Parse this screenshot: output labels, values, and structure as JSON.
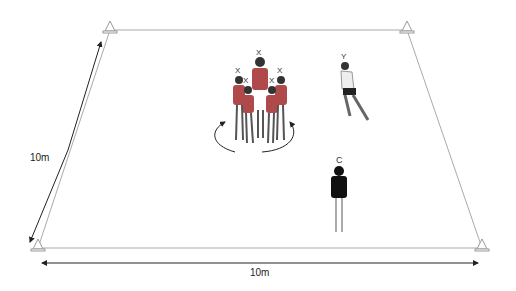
{
  "dimensions": {
    "width_label": "10m",
    "length_label": "10m"
  },
  "players": {
    "scrum_markers": [
      "X",
      "X",
      "X",
      "X",
      "X",
      "X"
    ],
    "runner_label": "Y",
    "coach_label": "C"
  },
  "colors": {
    "line": "#aaaaaa",
    "arrow": "#222222",
    "jersey": "#b04a4a",
    "coach": "#111111"
  }
}
